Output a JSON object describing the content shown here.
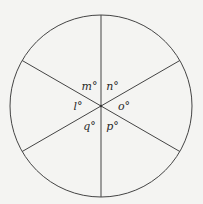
{
  "figure": {
    "colors": {
      "background": "#f4f4f2",
      "stroke": "#444444",
      "text": "#2a2a2a"
    },
    "diameters": [
      {
        "name": "vertical-diameter",
        "angle_deg": 90
      },
      {
        "name": "rising-diameter",
        "angle_deg": 30
      },
      {
        "name": "falling-diameter",
        "angle_deg": 150
      }
    ],
    "angle_labels": [
      {
        "name": "angle-m",
        "text": "m°",
        "sector_mid_deg": 120
      },
      {
        "name": "angle-n",
        "text": "n°",
        "sector_mid_deg": 60
      },
      {
        "name": "angle-o",
        "text": "o°",
        "sector_mid_deg": 0
      },
      {
        "name": "angle-p",
        "text": "p°",
        "sector_mid_deg": 300
      },
      {
        "name": "angle-q",
        "text": "q°",
        "sector_mid_deg": 240
      },
      {
        "name": "angle-l",
        "text": "l°",
        "sector_mid_deg": 180
      }
    ]
  }
}
